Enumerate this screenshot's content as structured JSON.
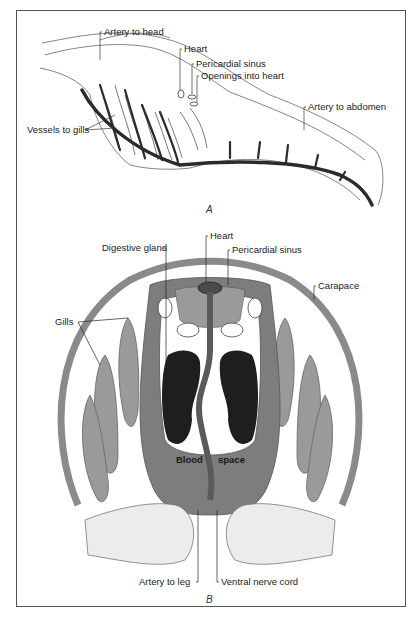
{
  "figure": {
    "panel_a": {
      "caption": "A",
      "labels": {
        "artery_to_head": "Artery to head",
        "heart": "Heart",
        "pericardial_sinus": "Pericardial sinus",
        "openings_into_heart": "Openings into heart",
        "artery_to_abdomen": "Artery to abdomen",
        "vessels_to_gills": "Vessels to gills"
      }
    },
    "panel_b": {
      "caption": "B",
      "labels": {
        "heart": "Heart",
        "digestive_gland": "Digestive gland",
        "pericardial_sinus": "Pericardial sinus",
        "carapace": "Carapace",
        "gills": "Gills",
        "blood": "Blood",
        "space": "space",
        "artery_to_leg": "Artery to leg",
        "ventral_nerve_cord": "Ventral nerve cord"
      }
    },
    "colors": {
      "vessel_dark": "#2b2b2b",
      "carapace_gray": "#8a8a8a",
      "blood_space_gray": "#7d7d7d",
      "gill_gray": "#9a9a9a",
      "gland_black": "#1e1e1e",
      "outline": "#555555"
    }
  }
}
